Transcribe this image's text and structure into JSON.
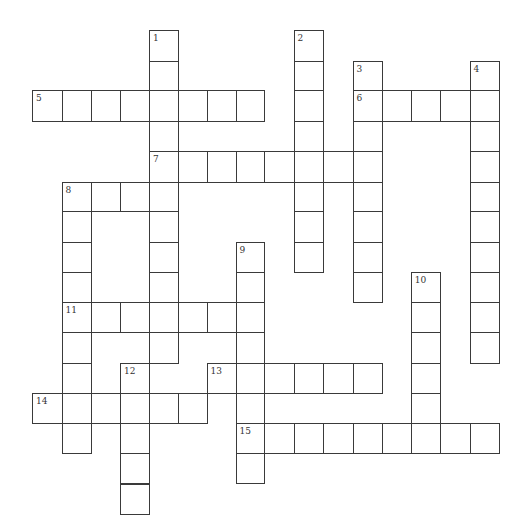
{
  "puzzle": {
    "title": "",
    "grid_size": {
      "cols": 16,
      "rows": 16
    },
    "colors": {
      "line": "#3a3a3a",
      "cell_fill": "#ffffff",
      "number": "#333333"
    },
    "entries": [
      {
        "number": 1,
        "direction": "down",
        "row": 0,
        "col": 4,
        "length": 11
      },
      {
        "number": 2,
        "direction": "down",
        "row": 0,
        "col": 9,
        "length": 8
      },
      {
        "number": 3,
        "direction": "down",
        "row": 1,
        "col": 11,
        "length": 8
      },
      {
        "number": 4,
        "direction": "down",
        "row": 1,
        "col": 15,
        "length": 10
      },
      {
        "number": 5,
        "direction": "across",
        "row": 2,
        "col": 0,
        "length": 8
      },
      {
        "number": 6,
        "direction": "across",
        "row": 2,
        "col": 11,
        "length": 5
      },
      {
        "number": 7,
        "direction": "across",
        "row": 4,
        "col": 4,
        "length": 8
      },
      {
        "number": 8,
        "direction": "across",
        "row": 5,
        "col": 1,
        "length": 4
      },
      {
        "number": 8,
        "direction": "down",
        "row": 5,
        "col": 1,
        "length": 9
      },
      {
        "number": 9,
        "direction": "down",
        "row": 7,
        "col": 7,
        "length": 8
      },
      {
        "number": 10,
        "direction": "down",
        "row": 8,
        "col": 13,
        "length": 6
      },
      {
        "number": 11,
        "direction": "across",
        "row": 9,
        "col": 1,
        "length": 7
      },
      {
        "number": 12,
        "direction": "down",
        "row": 11,
        "col": 3,
        "length": 5
      },
      {
        "number": 13,
        "direction": "across",
        "row": 11,
        "col": 6,
        "length": 6
      },
      {
        "number": 14,
        "direction": "across",
        "row": 12,
        "col": 0,
        "length": 6
      },
      {
        "number": 15,
        "direction": "across",
        "row": 13,
        "col": 7,
        "length": 9
      }
    ]
  }
}
